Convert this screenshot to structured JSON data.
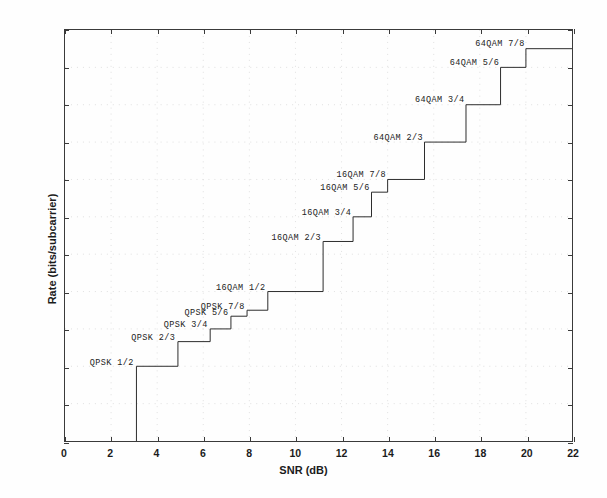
{
  "figure": {
    "background": "#ffffff",
    "line_color": "#2b2b2b",
    "axis_color": "#3a3a3a",
    "grid_color": "#cccccc"
  },
  "chart_data": {
    "type": "line",
    "style": "staircase",
    "title": "",
    "xlabel": "SNR (dB)",
    "ylabel": "Rate (bits/subcarrier)",
    "xlim": [
      0,
      22
    ],
    "ylim": [
      0,
      5.5
    ],
    "xticks": [
      0,
      2,
      4,
      6,
      8,
      10,
      12,
      14,
      16,
      18,
      20,
      22
    ],
    "yticks": [
      0,
      0.5,
      1,
      1.5,
      2,
      2.5,
      3,
      3.5,
      4,
      4.5,
      5,
      5.5
    ],
    "xticklabels": [
      "0",
      "2",
      "4",
      "6",
      "8",
      "10",
      "12",
      "14",
      "16",
      "18",
      "20",
      "22"
    ],
    "yticklabels": [
      "0",
      "0.5",
      "1",
      "1.5",
      "2",
      "2.5",
      "3",
      "3.5",
      "4",
      "4.5",
      "5",
      "5.5"
    ],
    "grid": true,
    "grid_style": "dotted",
    "legend": "none",
    "annotations_inline": true,
    "series": [
      {
        "name": "Adaptive modulation and coding rate",
        "points": [
          {
            "label": "QPSK 1/2",
            "snr_start": 3.1,
            "snr_end": 4.9,
            "rate": 1.0
          },
          {
            "label": "QPSK 2/3",
            "snr_start": 4.9,
            "snr_end": 6.3,
            "rate": 1.33
          },
          {
            "label": "QPSK 3/4",
            "snr_start": 6.3,
            "snr_end": 7.2,
            "rate": 1.5
          },
          {
            "label": "QPSK 5/6",
            "snr_start": 7.2,
            "snr_end": 7.9,
            "rate": 1.67
          },
          {
            "label": "QPSK 7/8",
            "snr_start": 7.9,
            "snr_end": 8.8,
            "rate": 1.75
          },
          {
            "label": "16QAM 1/2",
            "snr_start": 8.8,
            "snr_end": 11.2,
            "rate": 2.0
          },
          {
            "label": "16QAM 2/3",
            "snr_start": 11.2,
            "snr_end": 12.5,
            "rate": 2.67
          },
          {
            "label": "16QAM 3/4",
            "snr_start": 12.5,
            "snr_end": 13.3,
            "rate": 3.0
          },
          {
            "label": "16QAM 5/6",
            "snr_start": 13.3,
            "snr_end": 14.0,
            "rate": 3.33
          },
          {
            "label": "16QAM 7/8",
            "snr_start": 14.0,
            "snr_end": 15.6,
            "rate": 3.5
          },
          {
            "label": "64QAM 2/3",
            "snr_start": 15.6,
            "snr_end": 17.4,
            "rate": 4.0
          },
          {
            "label": "64QAM 3/4",
            "snr_start": 17.4,
            "snr_end": 18.9,
            "rate": 4.5
          },
          {
            "label": "64QAM 5/6",
            "snr_start": 18.9,
            "snr_end": 20.0,
            "rate": 5.0
          },
          {
            "label": "64QAM 7/8",
            "snr_start": 20.0,
            "snr_end": 22.0,
            "rate": 5.25
          }
        ]
      }
    ]
  }
}
